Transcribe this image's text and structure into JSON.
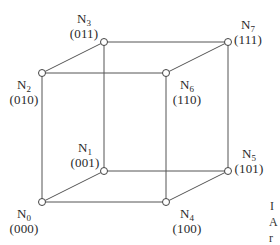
{
  "diagram": {
    "type": "hypercube-3d",
    "nodes": [
      {
        "id": "N0",
        "name": "N",
        "index": "0",
        "code": "(000)",
        "x": 42,
        "y": 202,
        "label_x": 24,
        "label_y": 206
      },
      {
        "id": "N1",
        "name": "N",
        "index": "1",
        "code": "(001)",
        "x": 104,
        "y": 171,
        "label_x": 85,
        "label_y": 140
      },
      {
        "id": "N2",
        "name": "N",
        "index": "2",
        "code": "(010)",
        "x": 42,
        "y": 73,
        "label_x": 24,
        "label_y": 77
      },
      {
        "id": "N3",
        "name": "N",
        "index": "3",
        "code": "(011)",
        "x": 104,
        "y": 42,
        "label_x": 84,
        "label_y": 11
      },
      {
        "id": "N4",
        "name": "N",
        "index": "4",
        "code": "(100)",
        "x": 166,
        "y": 202,
        "label_x": 187,
        "label_y": 206
      },
      {
        "id": "N5",
        "name": "N",
        "index": "5",
        "code": "(101)",
        "x": 228,
        "y": 171,
        "label_x": 249,
        "label_y": 146
      },
      {
        "id": "N6",
        "name": "N",
        "index": "6",
        "code": "(110)",
        "x": 166,
        "y": 73,
        "label_x": 187,
        "label_y": 77
      },
      {
        "id": "N7",
        "name": "N",
        "index": "7",
        "code": "(111)",
        "x": 228,
        "y": 42,
        "label_x": 248,
        "label_y": 17
      }
    ],
    "edges": [
      [
        "N0",
        "N1"
      ],
      [
        "N0",
        "N2"
      ],
      [
        "N0",
        "N4"
      ],
      [
        "N1",
        "N3"
      ],
      [
        "N1",
        "N5"
      ],
      [
        "N2",
        "N3"
      ],
      [
        "N2",
        "N6"
      ],
      [
        "N3",
        "N7"
      ],
      [
        "N4",
        "N5"
      ],
      [
        "N4",
        "N6"
      ],
      [
        "N5",
        "N7"
      ],
      [
        "N6",
        "N7"
      ]
    ],
    "colors": {
      "edge": "#555555",
      "node_fill": "#ffffff",
      "node_stroke": "#444444",
      "text": "#2a2a2a"
    }
  },
  "cropped_caption_fragments": [
    {
      "text": "I",
      "x": 270,
      "y": 199
    },
    {
      "text": "A",
      "x": 269,
      "y": 215
    },
    {
      "text": "r",
      "x": 269,
      "y": 231
    }
  ]
}
